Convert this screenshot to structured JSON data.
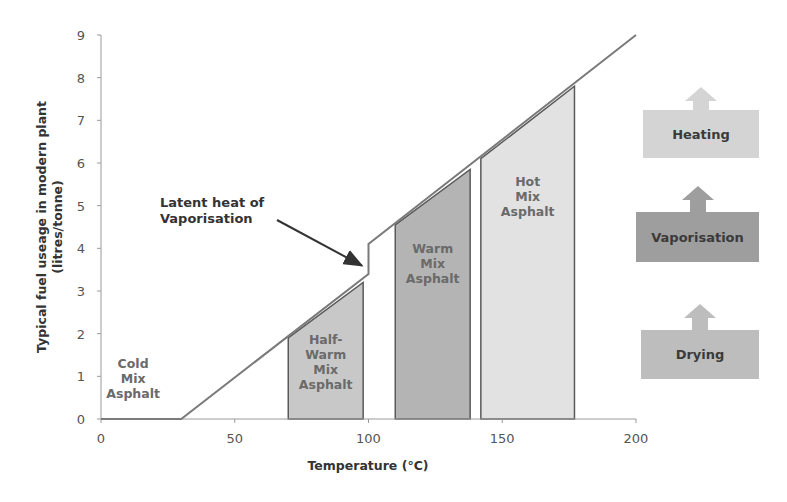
{
  "chart_data": {
    "type": "line",
    "title": "",
    "xlabel": "Temperature (°C)",
    "ylabel": "Typical fuel useage in modern plant (litres/tonne)",
    "ylabel_lines": [
      "Typical fuel useage in modern plant",
      "(litres/tonne)"
    ],
    "xlim": [
      0,
      200
    ],
    "ylim": [
      0,
      9
    ],
    "x_ticks": [
      0,
      50,
      100,
      150,
      200
    ],
    "y_ticks": [
      0,
      1,
      2,
      3,
      4,
      5,
      6,
      7,
      8,
      9
    ],
    "grid": false,
    "series": [
      {
        "name": "Typical fuel usage",
        "x": [
          0,
          30,
          100,
          100,
          200
        ],
        "y": [
          0,
          0,
          3.4,
          4.1,
          9.0
        ],
        "color": "#7a7a7a"
      }
    ],
    "regions": [
      {
        "name": "Cold Mix Asphalt",
        "label_lines": [
          "Cold",
          "Mix",
          "Asphalt"
        ],
        "x_start": 0,
        "x_end": 30,
        "y_top": 0,
        "fill": null,
        "label_x": 12,
        "label_y": 1.2
      },
      {
        "name": "Half-Warm Mix Asphalt",
        "label_lines": [
          "Half-",
          "Warm",
          "Mix",
          "Asphalt"
        ],
        "x_start": 70,
        "x_end": 98,
        "y_top_left": 1.9,
        "y_top_right": 3.2,
        "fill": "#c8c8c8",
        "label_x": 84,
        "label_y": 1.75
      },
      {
        "name": "Warm Mix Asphalt",
        "label_lines": [
          "Warm",
          "Mix",
          "Asphalt"
        ],
        "x_start": 110,
        "x_end": 138,
        "y_top_left": 4.55,
        "y_top_right": 5.85,
        "fill": "#b4b4b4",
        "label_x": 124,
        "label_y": 3.9
      },
      {
        "name": "Hot Mix Asphalt",
        "label_lines": [
          "Hot",
          "Mix",
          "Asphalt"
        ],
        "x_start": 142,
        "x_end": 177,
        "y_top_left": 6.1,
        "y_top_right": 7.8,
        "fill": "#e2e2e2",
        "label_x": 159.5,
        "label_y": 5.45
      }
    ],
    "annotations": [
      {
        "text_lines": [
          "Latent heat of",
          "Vaporisation"
        ],
        "arrow_to_x": 99,
        "arrow_to_y": 3.5
      }
    ],
    "legend": {
      "position": "right",
      "entries": [
        {
          "label": "Heating",
          "color": "#d4d4d4"
        },
        {
          "label": "Vaporisation",
          "color": "#9e9e9e"
        },
        {
          "label": "Drying",
          "color": "#bdbdbd"
        }
      ]
    }
  }
}
